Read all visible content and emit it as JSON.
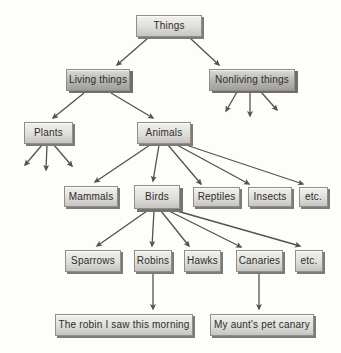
{
  "diagram": {
    "type": "hierarchy-tree",
    "colors": {
      "background": "#fdfdfc",
      "edge": "#53524d",
      "node_border": "#8f8e88",
      "node_fill_light": "#dededa",
      "node_fill_dark": "#b7b6b2",
      "node_shadow": "#7c7b75",
      "text": "#2e2d29"
    },
    "nodes": {
      "things": {
        "label": "Things"
      },
      "living_things": {
        "label": "Living things"
      },
      "nonliving_things": {
        "label": "Nonliving things"
      },
      "plants": {
        "label": "Plants"
      },
      "animals": {
        "label": "Animals"
      },
      "mammals": {
        "label": "Mammals"
      },
      "birds": {
        "label": "Birds"
      },
      "reptiles": {
        "label": "Reptiles"
      },
      "insects": {
        "label": "Insects"
      },
      "etc_animals": {
        "label": "etc."
      },
      "sparrows": {
        "label": "Sparrows"
      },
      "robins": {
        "label": "Robins"
      },
      "hawks": {
        "label": "Hawks"
      },
      "canaries": {
        "label": "Canaries"
      },
      "etc_birds": {
        "label": "etc."
      },
      "robin_instance": {
        "label": "The robin I saw this morning"
      },
      "canary_instance": {
        "label": "My aunt's pet canary"
      }
    },
    "edges": [
      {
        "from": "things",
        "to": "living_things",
        "x1": 148,
        "y1": 38,
        "x2": 117,
        "y2": 65
      },
      {
        "from": "things",
        "to": "nonliving_things",
        "x1": 190,
        "y1": 38,
        "x2": 219,
        "y2": 65
      },
      {
        "from": "living_things",
        "to": "plants",
        "x1": 84,
        "y1": 93,
        "x2": 53,
        "y2": 118
      },
      {
        "from": "living_things",
        "to": "animals",
        "x1": 111,
        "y1": 93,
        "x2": 153,
        "y2": 118
      },
      {
        "from": "nonliving_things",
        "to": "unlabeled",
        "x1": 237,
        "y1": 92,
        "x2": 226,
        "y2": 111
      },
      {
        "from": "nonliving_things",
        "to": "unlabeled",
        "x1": 250,
        "y1": 92,
        "x2": 250,
        "y2": 116
      },
      {
        "from": "nonliving_things",
        "to": "unlabeled",
        "x1": 261,
        "y1": 92,
        "x2": 277,
        "y2": 110
      },
      {
        "from": "plants",
        "to": "unlabeled",
        "x1": 42,
        "y1": 145,
        "x2": 25,
        "y2": 165
      },
      {
        "from": "plants",
        "to": "unlabeled",
        "x1": 47,
        "y1": 145,
        "x2": 46,
        "y2": 170
      },
      {
        "from": "plants",
        "to": "unlabeled",
        "x1": 54,
        "y1": 145,
        "x2": 72,
        "y2": 166
      },
      {
        "from": "animals",
        "to": "mammals",
        "x1": 150,
        "y1": 145,
        "x2": 95,
        "y2": 182
      },
      {
        "from": "animals",
        "to": "birds",
        "x1": 159,
        "y1": 145,
        "x2": 153,
        "y2": 181
      },
      {
        "from": "animals",
        "to": "reptiles",
        "x1": 168,
        "y1": 145,
        "x2": 201,
        "y2": 184
      },
      {
        "from": "animals",
        "to": "insects",
        "x1": 177,
        "y1": 145,
        "x2": 249,
        "y2": 184
      },
      {
        "from": "animals",
        "to": "etc_animals",
        "x1": 186,
        "y1": 145,
        "x2": 303,
        "y2": 184
      },
      {
        "from": "birds",
        "to": "sparrows",
        "x1": 147,
        "y1": 211,
        "x2": 97,
        "y2": 246
      },
      {
        "from": "birds",
        "to": "robins",
        "x1": 154,
        "y1": 211,
        "x2": 152,
        "y2": 246
      },
      {
        "from": "birds",
        "to": "hawks",
        "x1": 161,
        "y1": 211,
        "x2": 189,
        "y2": 246
      },
      {
        "from": "birds",
        "to": "canaries",
        "x1": 169,
        "y1": 211,
        "x2": 241,
        "y2": 247
      },
      {
        "from": "birds",
        "to": "etc_birds",
        "x1": 177,
        "y1": 211,
        "x2": 300,
        "y2": 246
      },
      {
        "from": "robins",
        "to": "robin_instance",
        "x1": 153,
        "y1": 273,
        "x2": 153,
        "y2": 309
      },
      {
        "from": "canaries",
        "to": "canary_instance",
        "x1": 259,
        "y1": 273,
        "x2": 259,
        "y2": 309
      }
    ]
  }
}
